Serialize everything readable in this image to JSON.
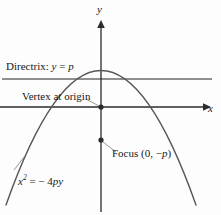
{
  "figure": {
    "type": "parabola-diagram",
    "axes": {
      "y_label": "y",
      "x_label": "x"
    },
    "labels": {
      "directrix": {
        "prefix": "Directrix: ",
        "var_y": "y",
        "equals": " = ",
        "var_p": "p"
      },
      "vertex": "Vertex at origin",
      "focus": {
        "prefix": "Focus (0, −",
        "var_p": "p",
        "suffix": ")"
      },
      "equation": {
        "var_x": "x",
        "exponent": "2",
        "equals": " = − 4",
        "var_py": "py"
      }
    },
    "colors": {
      "background": "#fdfdfd",
      "axis": "#2b2b2b",
      "curve": "#555555",
      "directrix": "#6a6a6a",
      "leader": "#8a8a8a",
      "point": "#2b2b2b",
      "text": "#181818"
    },
    "geometry": {
      "origin": [
        101,
        107
      ],
      "focus_point": [
        101,
        140
      ],
      "directrix_y": 79,
      "x_axis_y": 107,
      "y_axis_x": 101
    }
  }
}
